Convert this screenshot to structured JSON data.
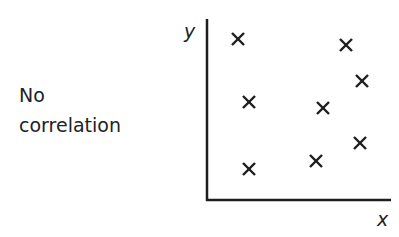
{
  "caption": {
    "line1": "No",
    "line2": "correlation"
  },
  "chart_data": {
    "type": "scatter",
    "title": "No correlation",
    "xlabel": "x",
    "ylabel": "y",
    "marker": "x",
    "grid": false,
    "ticks": false,
    "xlim": [
      0,
      10
    ],
    "ylim": [
      0,
      10
    ],
    "points": [
      {
        "x": 1.7,
        "y": 8.9
      },
      {
        "x": 7.5,
        "y": 8.6
      },
      {
        "x": 8.4,
        "y": 6.6
      },
      {
        "x": 2.3,
        "y": 5.4
      },
      {
        "x": 6.3,
        "y": 5.1
      },
      {
        "x": 8.3,
        "y": 3.2
      },
      {
        "x": 5.9,
        "y": 2.2
      },
      {
        "x": 2.3,
        "y": 1.8
      }
    ],
    "pixel_points": [
      [
        238,
        39
      ],
      [
        346,
        45
      ],
      [
        362,
        81
      ],
      [
        249,
        102
      ],
      [
        323,
        108
      ],
      [
        360,
        143
      ],
      [
        316,
        161
      ],
      [
        249,
        169
      ]
    ]
  }
}
